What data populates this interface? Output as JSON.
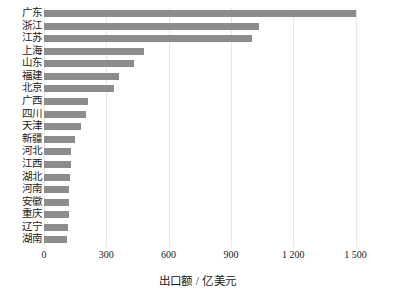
{
  "chart_data": {
    "type": "bar",
    "orientation": "horizontal",
    "title": "",
    "xlabel": "出口额 / 亿美元",
    "ylabel": "",
    "xlim": [
      0,
      1560
    ],
    "grid": true,
    "legend": "none",
    "bar_color": "#8c8c8c",
    "xticks": [
      "0",
      "300",
      "600",
      "900",
      "1 200",
      "1 500"
    ],
    "xtick_values": [
      0,
      300,
      600,
      900,
      1200,
      1500
    ],
    "categories": [
      "广东",
      "浙江",
      "江苏",
      "上海",
      "山东",
      "福建",
      "北京",
      "广西",
      "四川",
      "天津",
      "新疆",
      "河北",
      "江西",
      "湖北",
      "河南",
      "安徽",
      "重庆",
      "辽宁",
      "湖南"
    ],
    "values": [
      1500,
      1035,
      1000,
      483,
      432,
      362,
      339,
      214,
      200,
      176,
      149,
      130,
      128,
      124,
      122,
      120,
      118,
      115,
      112
    ]
  }
}
